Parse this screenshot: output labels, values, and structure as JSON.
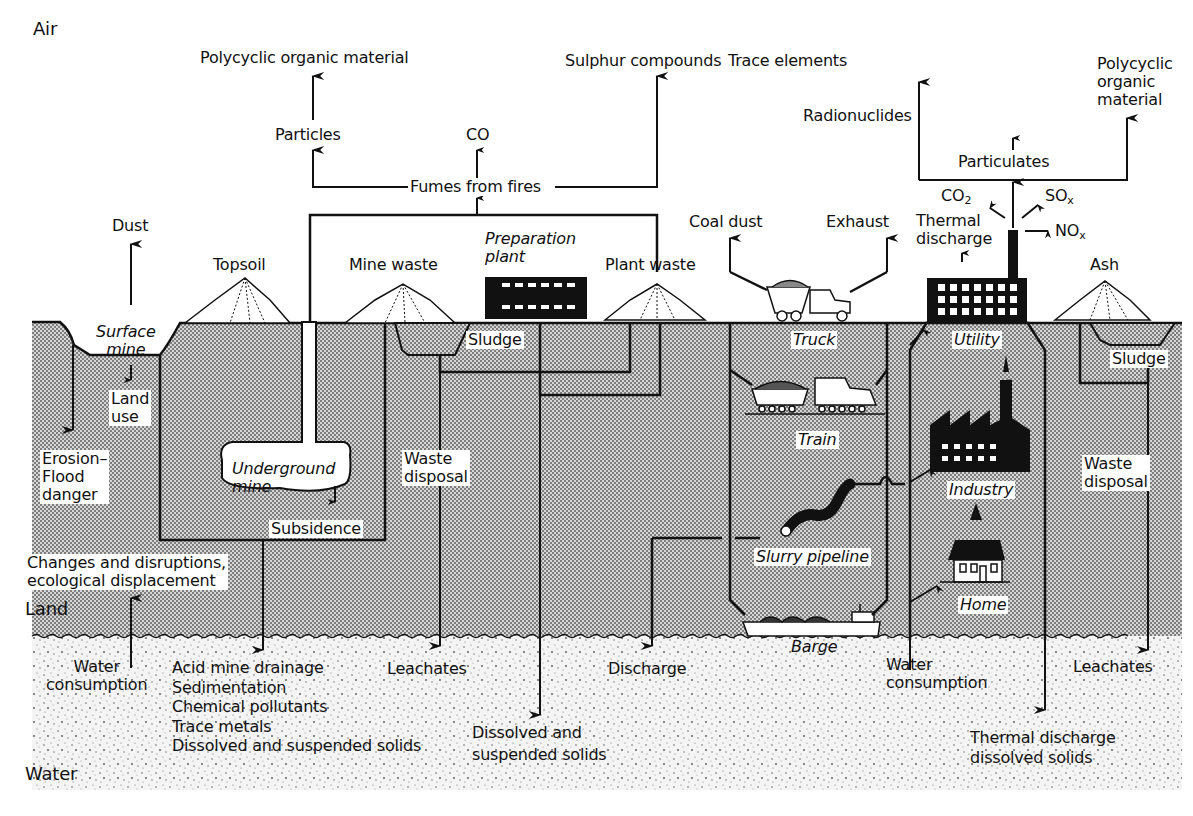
{
  "diagram": {
    "zones": {
      "air": "Air",
      "land": "Land",
      "water": "Water"
    },
    "air_emissions": {
      "polycyclic_left": "Polycyclic organic material",
      "particles": "Particles",
      "co": "CO",
      "sulphur": "Sulphur compounds",
      "fumes": "Fumes from fires",
      "trace_elements": "Trace elements",
      "radionuclides": "Radionuclides",
      "particulates": "Particulates",
      "polycyclic_right": "Polycyclic\norganic\nmaterial",
      "co2": "CO",
      "co2_sub": "2",
      "sox": "SO",
      "sox_sub": "x",
      "nox": "NO",
      "nox_sub": "x",
      "dust": "Dust",
      "coal_dust": "Coal dust",
      "exhaust": "Exhaust",
      "thermal_discharge_air": "Thermal\ndischarge"
    },
    "surface_features": {
      "topsoil": "Topsoil",
      "mine_waste": "Mine waste",
      "preparation_plant": "Preparation\nplant",
      "plant_waste": "Plant waste",
      "ash": "Ash"
    },
    "land_labels": {
      "surface_mine": "Surface\nmine",
      "land_use": "Land\nuse",
      "erosion": "Erosion–\nFlood\ndanger",
      "underground_mine": "Underground\nmine",
      "subsidence": "Subsidence",
      "sludge_left": "Sludge",
      "waste_disposal_left": "Waste\ndisposal",
      "changes": "Changes and disruptions,\necological displacement",
      "truck": "Truck",
      "train": "Train",
      "slurry_pipeline": "Slurry pipeline",
      "barge": "Barge",
      "utility": "Utility",
      "industry": "Industry",
      "home": "Home",
      "sludge_right": "Sludge",
      "waste_disposal_right": "Waste\ndisposal"
    },
    "water_labels": {
      "water_consumption_left": "Water\nconsumption",
      "acid_list": "Acid mine drainage\nSedimentation\nChemical pollutants\nTrace metals\nDissolved and suspended solids",
      "leachates_left": "Leachates",
      "dissolved_suspended": "Dissolved and\nsuspended solids",
      "discharge": "Discharge",
      "water_consumption_right": "Water\nconsumption",
      "thermal_dissolved": "Thermal discharge\ndissolved solids",
      "leachates_right": "Leachates"
    },
    "colors": {
      "ink": "#111111",
      "paper": "#ffffff",
      "land_fill": "#bdbdbd",
      "water_fill": "#efefef"
    }
  }
}
